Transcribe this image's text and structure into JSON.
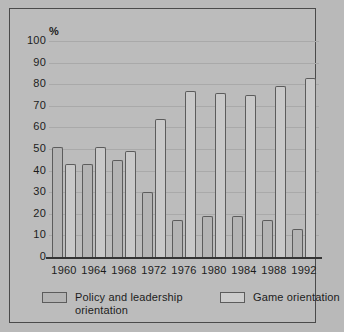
{
  "chart_data": {
    "type": "bar",
    "title": "",
    "subtitle": "",
    "xlabel": "",
    "ylabel": "%",
    "ylim": [
      0,
      100
    ],
    "ytick_step": 10,
    "yticks": [
      100,
      90,
      80,
      70,
      60,
      50,
      40,
      30,
      20,
      10,
      0
    ],
    "grid": true,
    "grid_axis": "y",
    "legend_position": "bottom",
    "categories": [
      "1960",
      "1964",
      "1968",
      "1972",
      "1976",
      "1980",
      "1984",
      "1988",
      "1992"
    ],
    "series": [
      {
        "name": "Policy and leadership orientation",
        "values": [
          51,
          43,
          45,
          30,
          17,
          19,
          19,
          17,
          13
        ],
        "fill": "#b4b4b4",
        "stroke": "#5c5c5c"
      },
      {
        "name": "Game orientation",
        "values": [
          43,
          51,
          49,
          64,
          77,
          76,
          75,
          79,
          83
        ],
        "fill": "#c9c9c9",
        "stroke": "#5c5c5c"
      }
    ]
  },
  "legend": {
    "entries": [
      {
        "label": "Policy and leadership orientation",
        "swatch": "policy"
      },
      {
        "label": "Game orientation",
        "swatch": "game"
      }
    ]
  },
  "colors": {
    "background": "#b9b9b9",
    "panel": "#bcbcbc",
    "frame": "#4a4a4a",
    "gridline": "#a9a9a9",
    "axis": "#333333",
    "text": "#1c1c1c"
  }
}
